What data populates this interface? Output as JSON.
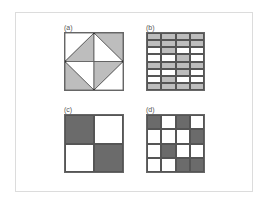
{
  "figure": {
    "colors": {
      "light_gray": "#bdbdbd",
      "dark_gray": "#6b6b6b",
      "white": "#ffffff",
      "line": "#555555"
    },
    "panels": [
      {
        "id": "a",
        "label": "(a)",
        "type": "triangulated-square",
        "regions": {
          "outer_top_left": "white",
          "outer_top_right": "light_gray",
          "outer_bottom_left": "light_gray",
          "outer_bottom_right": "white",
          "inner_top_left": "light_gray",
          "inner_top_right": "white",
          "inner_bottom_left": "white",
          "inner_bottom_right": "light_gray"
        }
      },
      {
        "id": "b",
        "label": "(b)",
        "type": "grid",
        "rows": 8,
        "cols": 4,
        "fill": "light_gray",
        "cells": [
          [
            1,
            1,
            1,
            1
          ],
          [
            1,
            1,
            1,
            1
          ],
          [
            0,
            1,
            0,
            0
          ],
          [
            0,
            0,
            1,
            0
          ],
          [
            1,
            1,
            1,
            1
          ],
          [
            0,
            0,
            1,
            0
          ],
          [
            0,
            1,
            0,
            0
          ],
          [
            1,
            1,
            1,
            1
          ]
        ]
      },
      {
        "id": "c",
        "label": "(c)",
        "type": "grid",
        "rows": 2,
        "cols": 2,
        "fill": "dark_gray",
        "cells": [
          [
            1,
            0
          ],
          [
            0,
            1
          ]
        ]
      },
      {
        "id": "d",
        "label": "(d)",
        "type": "grid",
        "rows": 4,
        "cols": 4,
        "fill": "dark_gray",
        "cells": [
          [
            1,
            0,
            1,
            0
          ],
          [
            0,
            0,
            0,
            1
          ],
          [
            0,
            1,
            0,
            0
          ],
          [
            0,
            0,
            1,
            1
          ]
        ]
      }
    ]
  }
}
